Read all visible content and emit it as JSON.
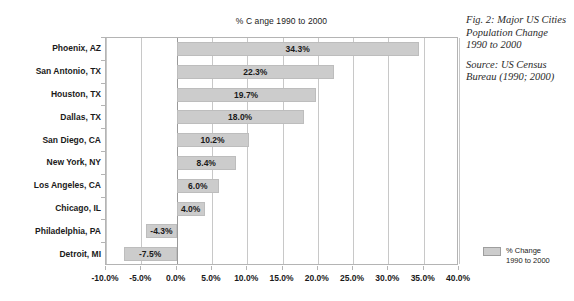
{
  "chart_data": {
    "type": "bar",
    "orientation": "horizontal",
    "title": "% C ange 1990 to 2000",
    "xlabel": "",
    "ylabel": "",
    "categories": [
      "Phoenix, AZ",
      "San Antonio, TX",
      "Houston, TX",
      "Dallas, TX",
      "San Diego, CA",
      "New York, NY",
      "Los Angeles, CA",
      "Chicago, IL",
      "Philadelphia, PA",
      "Detroit, MI"
    ],
    "values": [
      34.3,
      22.3,
      19.7,
      18.0,
      10.2,
      8.4,
      6.0,
      4.0,
      -4.3,
      -7.5
    ],
    "data_labels": [
      "34.3%",
      "22.3%",
      "19.7%",
      "18.0%",
      "10.2%",
      "8.4%",
      "6.0%",
      "4.0%",
      "-4.3%",
      "-7.5%"
    ],
    "series": [
      {
        "name": "% Change 1990 to 2000",
        "values": [
          34.3,
          22.3,
          19.7,
          18.0,
          10.2,
          8.4,
          6.0,
          4.0,
          -4.3,
          -7.5
        ]
      }
    ],
    "xlim": [
      -10.0,
      40.0
    ],
    "xticks": [
      -10.0,
      -5.0,
      0.0,
      5.0,
      10.0,
      15.0,
      20.0,
      25.0,
      30.0,
      35.0,
      40.0
    ],
    "xtick_labels": [
      "-10.0%",
      "-5.0%",
      "0.0%",
      "5.0%",
      "10.0%",
      "15.0%",
      "20.0%",
      "25.0%",
      "30.0%",
      "35.0%",
      "40.0%"
    ],
    "grid": "vertical",
    "legend_position": "right",
    "bar_color": "#cccccc",
    "bar_border_color": "#bdbdbd",
    "gridline_color": "#c8c8c8",
    "frame_color": "#b4b4b4"
  },
  "legend": {
    "entries": [
      {
        "label_line1": "% Change",
        "label_line2": "1990 to 2000",
        "color": "#cccccc"
      }
    ]
  },
  "caption": {
    "figure_text": "Fig. 2: Major US Cities Population Change 1990 to 2000",
    "source_text": "Source: US Census Bureau (1990; 2000)"
  }
}
